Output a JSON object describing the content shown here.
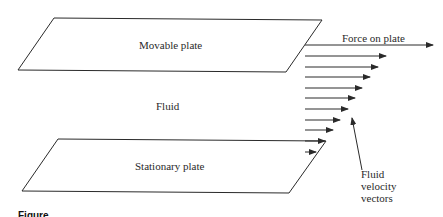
{
  "diagram": {
    "labels": {
      "movable_plate": "Movable plate",
      "fluid": "Fluid",
      "stationary_plate": "Stationary plate",
      "force": "Force on plate",
      "velocity_line1": "Fluid",
      "velocity_line2": "velocity",
      "velocity_line3": "vectors"
    },
    "caption": "Figure",
    "colors": {
      "line": "#2a2a2a",
      "background": "#ffffff"
    },
    "velocity_vectors": [
      {
        "y": 56,
        "x_end": 386
      },
      {
        "y": 67,
        "x_end": 378
      },
      {
        "y": 77,
        "x_end": 370
      },
      {
        "y": 88,
        "x_end": 362
      },
      {
        "y": 98,
        "x_end": 355
      },
      {
        "y": 109,
        "x_end": 348
      },
      {
        "y": 120,
        "x_end": 340
      },
      {
        "y": 130,
        "x_end": 333
      },
      {
        "y": 141,
        "x_end": 325
      },
      {
        "y": 152,
        "x_end": 316
      }
    ]
  }
}
